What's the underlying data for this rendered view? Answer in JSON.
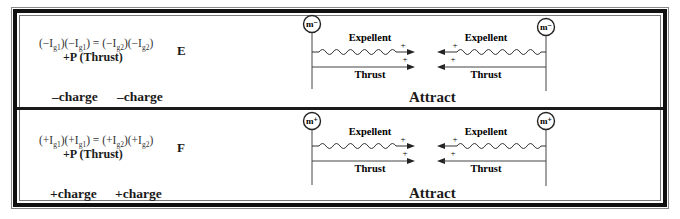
{
  "rows": [
    {
      "id": "E",
      "equation": {
        "lhs": [
          "(−I",
          "g1",
          ")(−I",
          "g1",
          ")"
        ],
        "rhs": [
          "(−I",
          "g2",
          ")(−I",
          "g2",
          ")"
        ],
        "equals": "="
      },
      "equation_text": "(−Ig1)(−Ig1) = (−Ig2)(−Ig2)",
      "pressure_label": "+P (Thrust)",
      "letter": "E",
      "charges": [
        "–charge",
        "–charge"
      ],
      "left_mass": "m⁻",
      "right_mass": "m⁻",
      "left_expellent": "Expellent",
      "right_expellent": "Expellent",
      "left_thrust": "Thrust",
      "right_thrust": "Thrust",
      "center_signs": [
        "+",
        "+",
        "+",
        "+"
      ],
      "result": "Attract"
    },
    {
      "id": "F",
      "equation": {
        "lhs": [
          "(+I",
          "g1",
          ")(+I",
          "g1",
          ")"
        ],
        "rhs": [
          "(+I",
          "g2",
          ")(+I",
          "g2",
          ")"
        ],
        "equals": "="
      },
      "equation_text": "(+Ig1)(+Ig1) = (+Ig2)(+Ig2)",
      "pressure_label": "+P (Thrust)",
      "letter": "F",
      "charges": [
        "+charge",
        "+charge"
      ],
      "left_mass": "m⁺",
      "right_mass": "m⁺",
      "left_expellent": "Expellent",
      "right_expellent": "Expellent",
      "left_thrust": "Thrust",
      "right_thrust": "Thrust",
      "center_signs": [
        "+",
        "+",
        "+",
        "+"
      ],
      "result": "Attract"
    }
  ],
  "colors": {
    "line": "#333333",
    "border": "#111111",
    "text": "#1a1a1a"
  }
}
